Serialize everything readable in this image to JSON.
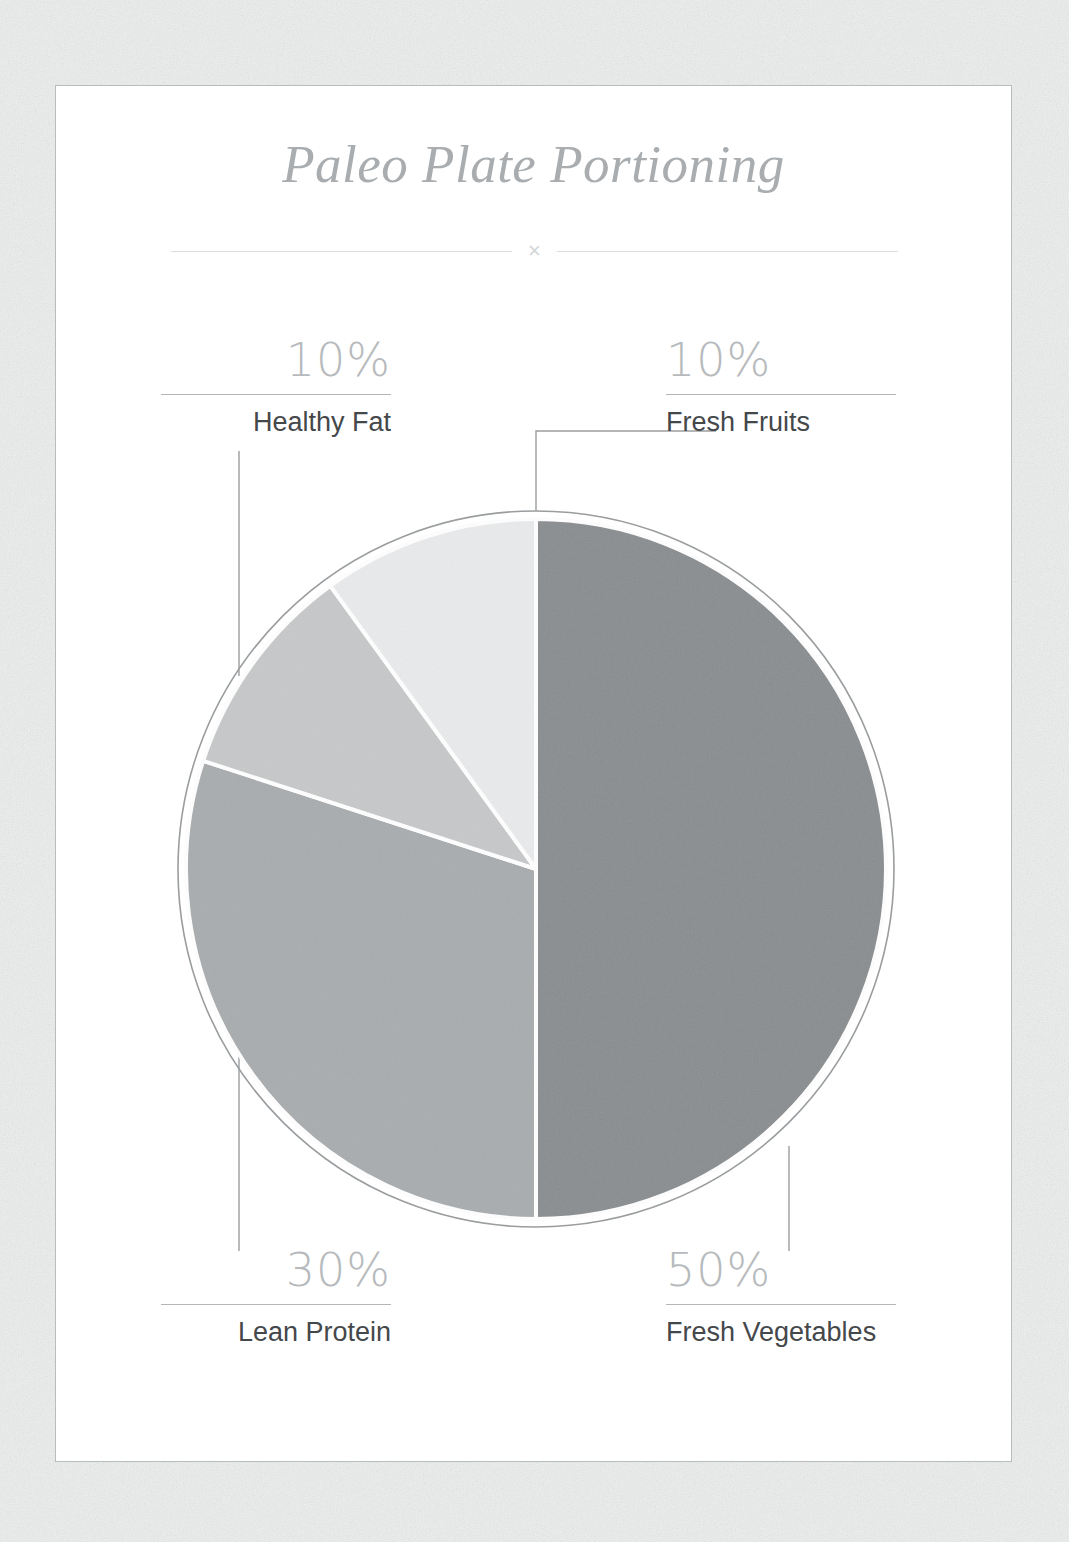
{
  "header": {
    "title": "Paleo Plate Portioning",
    "divider_ornament": "×"
  },
  "colors": {
    "page_background": "#eceded",
    "card_background": "#ffffff",
    "card_border": "#b9bcbd",
    "title_text": "#a9adb0",
    "percent_text": "#b7babc",
    "label_text": "#45484a",
    "rule": "#b4b7b9",
    "leader_line": "#9a9d9f",
    "pie_outline": "#9a9d9f",
    "slice_separator": "#ffffff"
  },
  "chart_data": {
    "type": "pie",
    "title": "Paleo Plate Portioning",
    "xlabel": "",
    "ylabel": "",
    "legend_position": "callouts",
    "grid": false,
    "total": 100,
    "unit": "%",
    "start_angle_deg": 0,
    "direction": "clockwise",
    "labels": [
      "Fresh Vegetables",
      "Lean Protein",
      "Healthy Fat",
      "Fresh Fruits"
    ],
    "values": [
      50,
      30,
      10,
      10
    ],
    "value_labels": [
      "50%",
      "30%",
      "10%",
      "10%"
    ],
    "slice_colors": [
      "#8a8d8f",
      "#a9acae",
      "#c6c8c9",
      "#e9eaeb"
    ],
    "slices": [
      {
        "label": "Fresh Vegetables",
        "value": 50,
        "value_label": "50%",
        "color": "#8a8d8f",
        "callout_position": "bottom-right"
      },
      {
        "label": "Lean Protein",
        "value": 30,
        "value_label": "30%",
        "color": "#a9acae",
        "callout_position": "bottom-left"
      },
      {
        "label": "Healthy Fat",
        "value": 10,
        "value_label": "10%",
        "color": "#c6c8c9",
        "callout_position": "top-left"
      },
      {
        "label": "Fresh Fruits",
        "value": 10,
        "value_label": "10%",
        "color": "#e9eaeb",
        "callout_position": "top-right"
      }
    ]
  },
  "callouts": {
    "healthy_fat": {
      "percent": "10%",
      "name": "Healthy Fat"
    },
    "fresh_fruits": {
      "percent": "10%",
      "name": "Fresh Fruits"
    },
    "lean_protein": {
      "percent": "30%",
      "name": "Lean Protein"
    },
    "fresh_vegetables": {
      "percent": "50%",
      "name": "Fresh Vegetables"
    }
  }
}
